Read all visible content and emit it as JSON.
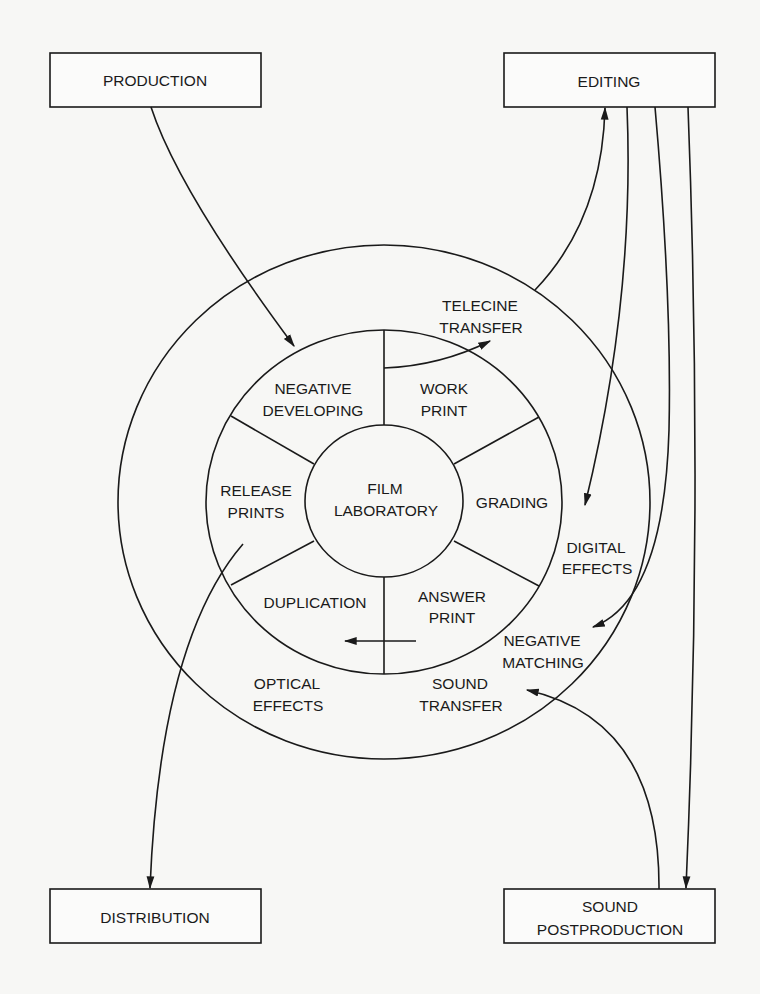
{
  "diagram": {
    "boxes": {
      "production": {
        "label": "PRODUCTION"
      },
      "editing": {
        "label": "EDITING"
      },
      "distribution": {
        "label": "DISTRIBUTION"
      },
      "sound_postproduction": {
        "line1": "SOUND",
        "line2": "POSTPRODUCTION"
      }
    },
    "center": {
      "line1": "FILM",
      "line2": "LABORATORY"
    },
    "inner_ring": {
      "negative_developing": {
        "line1": "NEGATIVE",
        "line2": "DEVELOPING"
      },
      "work_print": {
        "line1": "WORK",
        "line2": "PRINT"
      },
      "grading": {
        "line1": "GRADING"
      },
      "answer_print": {
        "line1": "ANSWER",
        "line2": "PRINT"
      },
      "duplication": {
        "line1": "DUPLICATION"
      },
      "release_prints": {
        "line1": "RELEASE",
        "line2": "PRINTS"
      }
    },
    "outer_ring": {
      "telecine_transfer": {
        "line1": "TELECINE",
        "line2": "TRANSFER"
      },
      "digital_effects": {
        "line1": "DIGITAL",
        "line2": "EFFECTS"
      },
      "negative_matching": {
        "line1": "NEGATIVE",
        "line2": "MATCHING"
      },
      "sound_transfer": {
        "line1": "SOUND",
        "line2": "TRANSFER"
      },
      "optical_effects": {
        "line1": "OPTICAL",
        "line2": "EFFECTS"
      }
    },
    "arrows": [
      {
        "from": "PRODUCTION",
        "to": "NEGATIVE DEVELOPING"
      },
      {
        "from": "WORK PRINT",
        "to": "TELECINE TRANSFER"
      },
      {
        "from": "TELECINE TRANSFER",
        "to": "EDITING"
      },
      {
        "from": "EDITING",
        "to": "DIGITAL EFFECTS"
      },
      {
        "from": "EDITING",
        "to": "NEGATIVE MATCHING"
      },
      {
        "from": "EDITING",
        "to": "SOUND POSTPRODUCTION"
      },
      {
        "from": "SOUND POSTPRODUCTION",
        "to": "SOUND TRANSFER"
      },
      {
        "from": "ANSWER PRINT",
        "to": "DUPLICATION"
      },
      {
        "from": "RELEASE PRINTS",
        "to": "DISTRIBUTION"
      }
    ],
    "colors": {
      "ink": "#1a1a1a",
      "paper": "#f7f7f5"
    }
  }
}
